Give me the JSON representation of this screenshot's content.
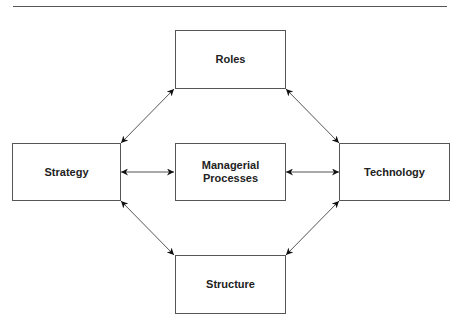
{
  "diagram": {
    "nodes": {
      "roles": "Roles",
      "strategy": "Strategy",
      "managerial": "Managerial\nProcesses",
      "technology": "Technology",
      "structure": "Structure"
    },
    "edges": [
      {
        "from": "strategy",
        "to": "roles",
        "type": "bidirectional"
      },
      {
        "from": "roles",
        "to": "technology",
        "type": "bidirectional"
      },
      {
        "from": "strategy",
        "to": "managerial",
        "type": "bidirectional"
      },
      {
        "from": "managerial",
        "to": "technology",
        "type": "bidirectional"
      },
      {
        "from": "strategy",
        "to": "structure",
        "type": "bidirectional"
      },
      {
        "from": "structure",
        "to": "technology",
        "type": "bidirectional"
      }
    ],
    "colors": {
      "line": "#555555",
      "arrow": "#111111",
      "text": "#222222"
    }
  }
}
